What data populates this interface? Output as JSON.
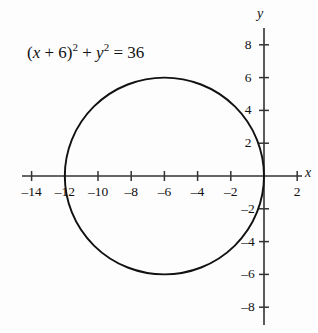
{
  "figure": {
    "equation_plain": "(x + 6)^2 + y^2 = 36",
    "equation_parts": {
      "open_paren": "(",
      "var_x": "x",
      "plus_six": " + 6",
      "close_paren": ")",
      "exp_two_a": "2",
      "plus": " + ",
      "var_y": "y",
      "exp_two_b": "2",
      "equals": " = 36"
    },
    "x_axis_name": "x",
    "y_axis_name": "y",
    "background_color": "#fdfdfd",
    "curve_color": "#111111",
    "axis_color": "#333333"
  },
  "chart_data": {
    "type": "line",
    "title": "",
    "subtitle": "",
    "xlabel": "x",
    "ylabel": "y",
    "annotations": [
      "(x + 6)^2 + y^2 = 36"
    ],
    "grid": false,
    "legend": "none",
    "xlim": [
      -15.5,
      3.0
    ],
    "ylim": [
      -9.3,
      9.3
    ],
    "x_ticks": [
      -14,
      -12,
      -10,
      -8,
      -6,
      -4,
      -2,
      2
    ],
    "x_tick_labels": [
      "–14",
      "–12",
      "–10",
      "–8",
      "–6",
      "–4",
      "–2",
      "2"
    ],
    "y_ticks": [
      8,
      6,
      4,
      2,
      -2,
      -4,
      -6,
      -8
    ],
    "y_tick_labels": [
      "8",
      "6",
      "4",
      "2",
      "–2",
      "–4",
      "–6",
      "–8"
    ],
    "series": [
      {
        "name": "(x + 6)^2 + y^2 = 36",
        "shape": "circle",
        "center_x": -6,
        "center_y": 0,
        "radius": 6,
        "key_points": [
          {
            "x": -12,
            "y": 0
          },
          {
            "x": 0,
            "y": 0
          },
          {
            "x": -6,
            "y": 6
          },
          {
            "x": -6,
            "y": -6
          }
        ]
      }
    ]
  },
  "geometry": {
    "origin_px_x": 264,
    "origin_px_y": 176,
    "x_scale_px_per_unit": 16.6,
    "y_scale_px_per_unit": 16.4,
    "x_axis_start_px": 22,
    "x_axis_end_px": 302,
    "y_axis_start_px": 28,
    "y_axis_end_px": 325,
    "tick_half_len": 5
  }
}
